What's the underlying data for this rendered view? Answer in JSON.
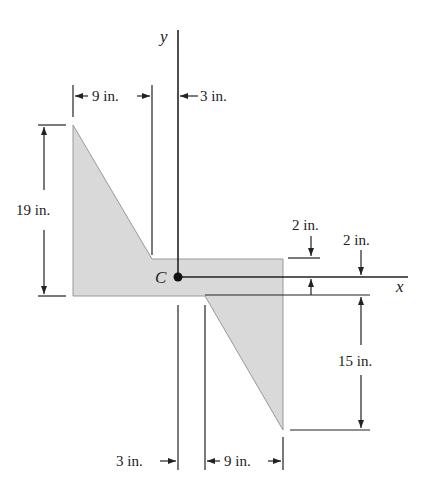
{
  "figure": {
    "type": "cross-section dimensioned diagram",
    "colors": {
      "fill": "#d9d9d9",
      "line": "#222222",
      "background": "#ffffff"
    },
    "axes": {
      "y_label": "y",
      "x_label": "x",
      "centroid_label": "C"
    },
    "dimensions": {
      "top_left_width": "9 in.",
      "top_offset": "3 in.",
      "left_height": "19 in.",
      "flange_top": "2 in.",
      "flange_bottom": "2 in.",
      "right_height": "15 in.",
      "bottom_offset": "3 in.",
      "bottom_right_width": "9 in."
    }
  }
}
